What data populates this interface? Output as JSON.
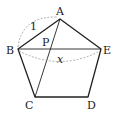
{
  "diagram": {
    "colors": {
      "stroke": "#222222",
      "dashed": "#999999",
      "background": "#ffffff"
    },
    "vertices": {
      "A": {
        "label": "A",
        "x": 60,
        "y": 19
      },
      "B": {
        "label": "B",
        "x": 18,
        "y": 49
      },
      "C": {
        "label": "C",
        "x": 35,
        "y": 97
      },
      "D": {
        "label": "D",
        "x": 88,
        "y": 97
      },
      "E": {
        "label": "E",
        "x": 101,
        "y": 49
      }
    },
    "intersection": {
      "label": "P",
      "x": 49,
      "y": 49
    },
    "measures": {
      "side_AB": "1",
      "diagonal_BE": "x"
    }
  }
}
